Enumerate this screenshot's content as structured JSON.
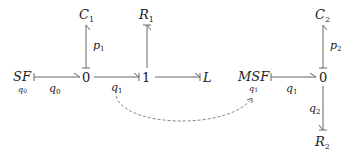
{
  "diagram": {
    "type": "bond-graph",
    "nodes": {
      "sf": {
        "label": "SF",
        "sub": "q",
        "sub_idx": "0"
      },
      "zero1": {
        "label": "0"
      },
      "c1": {
        "label": "C",
        "sub": "1"
      },
      "one": {
        "label": "1"
      },
      "r1": {
        "label": "R",
        "sub": "1"
      },
      "l": {
        "label": "L"
      },
      "msf": {
        "label": "MSF",
        "sub": "q",
        "sub_idx": "1"
      },
      "zero2": {
        "label": "0"
      },
      "c2": {
        "label": "C",
        "sub": "2"
      },
      "r2": {
        "label": "R",
        "sub": "2"
      }
    },
    "edges": [
      {
        "from": "SF",
        "to": "0",
        "label": "q",
        "idx": "0"
      },
      {
        "from": "0",
        "to": "C1",
        "label": "p",
        "idx": "1"
      },
      {
        "from": "0",
        "to": "1",
        "label": "q",
        "idx": "1"
      },
      {
        "from": "1",
        "to": "R1",
        "label": ""
      },
      {
        "from": "1",
        "to": "L",
        "label": ""
      },
      {
        "from": "MSF",
        "to": "0",
        "label": "q",
        "idx": "1"
      },
      {
        "from": "0",
        "to": "C2",
        "label": "p",
        "idx": "2"
      },
      {
        "from": "0",
        "to": "R2",
        "label": "q",
        "idx": "2"
      }
    ],
    "signal": {
      "from": "q1 (0→1 bond)",
      "to": "MSF",
      "style": "dashed"
    }
  }
}
